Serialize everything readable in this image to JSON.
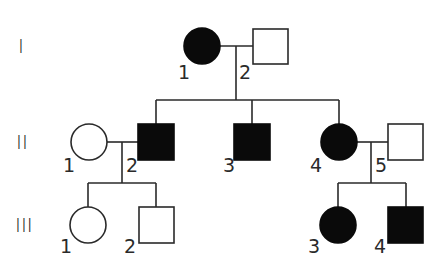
{
  "diagram": {
    "type": "pedigree",
    "generations": [
      {
        "label": "I"
      },
      {
        "label": "II"
      },
      {
        "label": "III"
      }
    ],
    "individuals": [
      {
        "id": "I-1",
        "generation": "I",
        "number": "1",
        "sex": "female",
        "affected": true
      },
      {
        "id": "I-2",
        "generation": "I",
        "number": "2",
        "sex": "male",
        "affected": false
      },
      {
        "id": "II-1",
        "generation": "II",
        "number": "1",
        "sex": "female",
        "affected": false
      },
      {
        "id": "II-2",
        "generation": "II",
        "number": "2",
        "sex": "male",
        "affected": true
      },
      {
        "id": "II-3",
        "generation": "II",
        "number": "3",
        "sex": "male",
        "affected": true
      },
      {
        "id": "II-4",
        "generation": "II",
        "number": "4",
        "sex": "female",
        "affected": true
      },
      {
        "id": "II-5",
        "generation": "II",
        "number": "5",
        "sex": "male",
        "affected": false
      },
      {
        "id": "III-1",
        "generation": "III",
        "number": "1",
        "sex": "female",
        "affected": false
      },
      {
        "id": "III-2",
        "generation": "III",
        "number": "2",
        "sex": "male",
        "affected": false
      },
      {
        "id": "III-3",
        "generation": "III",
        "number": "3",
        "sex": "female",
        "affected": true
      },
      {
        "id": "III-4",
        "generation": "III",
        "number": "4",
        "sex": "male",
        "affected": true
      }
    ],
    "matings": [
      {
        "partners": [
          "I-1",
          "I-2"
        ],
        "children": [
          "II-2",
          "II-3",
          "II-4"
        ]
      },
      {
        "partners": [
          "II-1",
          "II-2"
        ],
        "children": [
          "III-1",
          "III-2"
        ]
      },
      {
        "partners": [
          "II-4",
          "II-5"
        ],
        "children": [
          "III-3",
          "III-4"
        ]
      }
    ],
    "colors": {
      "affected": "#0a0a0a",
      "unaffected": "#ffffff",
      "stroke": "#2a2a2a"
    }
  }
}
